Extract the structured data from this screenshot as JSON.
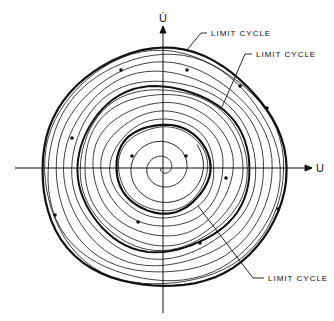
{
  "diagram": {
    "type": "phase-plane",
    "origin": {
      "x": 163,
      "y": 168
    },
    "axes": {
      "horizontal": {
        "label": "U",
        "x1": 15,
        "x2": 312
      },
      "vertical": {
        "label": "U̇",
        "y1": 26,
        "y2": 313
      }
    },
    "limit_cycles": [
      {
        "name": "outer",
        "rx": 122,
        "ry": 118,
        "stroke": 2.2,
        "label": "LIMIT CYCLE"
      },
      {
        "name": "middle",
        "rx": 86,
        "ry": 82,
        "stroke": 2.0,
        "label": "LIMIT CYCLE"
      },
      {
        "name": "inner",
        "rx": 47,
        "ry": 44,
        "stroke": 2.2,
        "label": "LIMIT CYCLE"
      }
    ],
    "trajectories": [
      {
        "r": 116,
        "ry": 112
      },
      {
        "r": 108,
        "ry": 104
      },
      {
        "r": 100,
        "ry": 96
      },
      {
        "r": 92,
        "ry": 88
      },
      {
        "r": 79,
        "ry": 75
      },
      {
        "r": 70,
        "ry": 66
      },
      {
        "r": 61,
        "ry": 57
      },
      {
        "r": 52,
        "ry": 49
      }
    ],
    "labels": [
      {
        "text": "LIMIT CYCLE",
        "x": 211,
        "y": 36,
        "leader": "M207,33 L201,33 L187,50"
      },
      {
        "text": "LIMIT CYCLE",
        "x": 256,
        "y": 57,
        "leader": "M252,54 L245,54 L222,107"
      },
      {
        "text": "LIMIT CYCLE",
        "x": 268,
        "y": 281,
        "leader": "M264,278 L253,278 L198,206"
      }
    ],
    "stroke_color": "#111111"
  }
}
